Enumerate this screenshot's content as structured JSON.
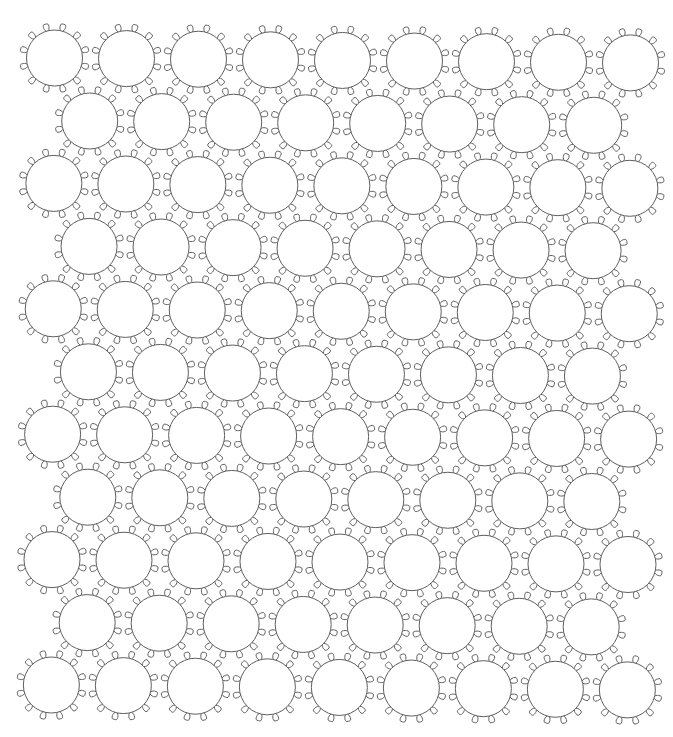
{
  "diagram": {
    "type": "circle-packing-pattern",
    "canvas": {
      "width": 673,
      "height": 737,
      "background": "#ffffff"
    },
    "style": {
      "stroke": "#5e5e5e",
      "stroke_width": 1,
      "fill": "#ffffff"
    },
    "circle": {
      "radius": 28,
      "loop_count": 12,
      "loop_start_angle_deg": 15,
      "loop_step_deg": 30,
      "loop_neck_radius": 28,
      "loop_outer_radius": 35,
      "loop_half_width": 2.8
    },
    "grid": {
      "row_count": 11,
      "odd_row_circle_count": 9,
      "even_row_circle_count": 8,
      "col_spacing": 72,
      "row_spacing": 62.7,
      "first_row_origin": {
        "x": 54.5,
        "y": 58
      },
      "even_row_offset_x": 35.5,
      "tilt_dy_per_px_x": 0.0085,
      "shear_dx_per_px_y": -0.005
    },
    "rows": [
      {
        "index": 1,
        "circles": 9
      },
      {
        "index": 2,
        "circles": 8
      },
      {
        "index": 3,
        "circles": 9
      },
      {
        "index": 4,
        "circles": 8
      },
      {
        "index": 5,
        "circles": 9
      },
      {
        "index": 6,
        "circles": 8
      },
      {
        "index": 7,
        "circles": 9
      },
      {
        "index": 8,
        "circles": 8
      },
      {
        "index": 9,
        "circles": 9
      },
      {
        "index": 10,
        "circles": 8
      },
      {
        "index": 11,
        "circles": 9
      }
    ]
  }
}
